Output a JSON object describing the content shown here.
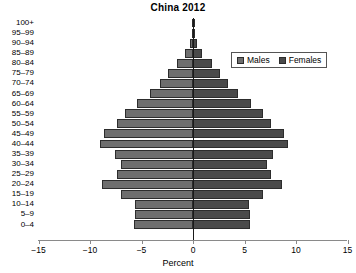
{
  "chart_data": {
    "type": "bar",
    "subtype": "population-pyramid",
    "title": "China 2012",
    "xlabel": "Percent",
    "ylabel": "",
    "xlim": [
      -15,
      15
    ],
    "xticks": [
      -15,
      -10,
      -5,
      0,
      5,
      10,
      15
    ],
    "xtick_labels": [
      "−15",
      "−10",
      "−5",
      "0",
      "5",
      "10",
      "15"
    ],
    "grid": false,
    "legend_position": "upper-right",
    "legend": [
      "Males",
      "Females"
    ],
    "colors": {
      "males": "#6e6e6e",
      "females": "#4a4a4a",
      "bar_outline": "#2c2c2c",
      "axis": "#8a8a8a",
      "zero_line": "#1a1a1a",
      "text": "#000000",
      "background": "#ffffff"
    },
    "categories": [
      "100+",
      "95–99",
      "90–94",
      "85–89",
      "80–84",
      "75–79",
      "70–74",
      "65–69",
      "60–64",
      "55–59",
      "50–54",
      "45–49",
      "40–44",
      "35–39",
      "30–34",
      "25–29",
      "20–24",
      "15–19",
      "10–14",
      "5–9",
      "0–4"
    ],
    "series": [
      {
        "name": "Males",
        "side": "left",
        "values": [
          0.02,
          0.1,
          0.3,
          0.8,
          1.6,
          2.4,
          3.2,
          4.2,
          5.4,
          6.6,
          7.4,
          8.6,
          9.0,
          7.6,
          7.0,
          7.4,
          8.8,
          7.0,
          5.6,
          5.6,
          5.7
        ]
      },
      {
        "name": "Females",
        "side": "right",
        "values": [
          0.02,
          0.1,
          0.35,
          0.9,
          1.8,
          2.6,
          3.4,
          4.4,
          5.6,
          6.8,
          7.6,
          8.8,
          9.2,
          7.8,
          7.2,
          7.6,
          8.6,
          6.8,
          5.4,
          5.5,
          5.5
        ]
      }
    ]
  },
  "axis": {
    "x_title": "Percent"
  }
}
